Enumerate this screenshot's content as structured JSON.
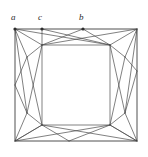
{
  "figure": {
    "kind": "geometric-line-diagram",
    "background_color": "#ffffff",
    "stroke_color": "#4a4a4a",
    "frame_color": "#3c3c3c",
    "label_color": "#2b2b2b",
    "canvas": {
      "width": 148,
      "height": 157
    },
    "frame": {
      "name": "outer-square",
      "corners": [
        {
          "name": "top-left",
          "x": 15,
          "y": 29
        },
        {
          "name": "top-right",
          "x": 137,
          "y": 29
        },
        {
          "name": "bottom-right",
          "x": 137,
          "y": 141
        },
        {
          "name": "bottom-left",
          "x": 15,
          "y": 141
        }
      ]
    },
    "labels": [
      {
        "id": "a",
        "text": "a",
        "x": 11,
        "y": 13,
        "vertex_x": 15,
        "vertex_y": 29
      },
      {
        "id": "c",
        "text": "c",
        "x": 38,
        "y": 13,
        "vertex_x": 42,
        "vertex_y": 29
      },
      {
        "id": "b",
        "text": "b",
        "x": 79,
        "y": 13,
        "vertex_x": 83,
        "vertex_y": 29
      }
    ],
    "marked_vertices": [
      {
        "id": "a",
        "x": 15,
        "y": 29
      },
      {
        "id": "c",
        "x": 42,
        "y": 29
      },
      {
        "id": "b",
        "x": 83,
        "y": 29
      }
    ],
    "interior_nodes": [
      {
        "id": "n-top-left-in",
        "x": 42,
        "y": 45
      },
      {
        "id": "n-top-right-in",
        "x": 110,
        "y": 45
      },
      {
        "id": "n-bottom-left-in",
        "x": 42,
        "y": 125
      },
      {
        "id": "n-bottom-right-in",
        "x": 110,
        "y": 125
      },
      {
        "id": "n-left-upper",
        "x": 27,
        "y": 57
      },
      {
        "id": "n-left-lower",
        "x": 27,
        "y": 113
      },
      {
        "id": "n-right-upper",
        "x": 125,
        "y": 57
      },
      {
        "id": "n-right-lower",
        "x": 125,
        "y": 113
      },
      {
        "id": "n-top-mid",
        "x": 83,
        "y": 29
      },
      {
        "id": "n-bottom-mid",
        "x": 69,
        "y": 141
      },
      {
        "id": "n-left-mid",
        "x": 15,
        "y": 85
      },
      {
        "id": "n-right-mid",
        "x": 137,
        "y": 71
      }
    ],
    "edges": [
      {
        "x1": 15,
        "y1": 29,
        "x2": 42,
        "y2": 45
      },
      {
        "x1": 15,
        "y1": 29,
        "x2": 27,
        "y2": 57
      },
      {
        "x1": 15,
        "y1": 29,
        "x2": 110,
        "y2": 45
      },
      {
        "x1": 42,
        "y1": 29,
        "x2": 42,
        "y2": 45
      },
      {
        "x1": 42,
        "y1": 29,
        "x2": 110,
        "y2": 45
      },
      {
        "x1": 83,
        "y1": 29,
        "x2": 42,
        "y2": 45
      },
      {
        "x1": 83,
        "y1": 29,
        "x2": 110,
        "y2": 45
      },
      {
        "x1": 137,
        "y1": 29,
        "x2": 110,
        "y2": 45
      },
      {
        "x1": 137,
        "y1": 29,
        "x2": 125,
        "y2": 57
      },
      {
        "x1": 137,
        "y1": 29,
        "x2": 42,
        "y2": 45
      },
      {
        "x1": 42,
        "y1": 45,
        "x2": 110,
        "y2": 45
      },
      {
        "x1": 42,
        "y1": 45,
        "x2": 27,
        "y2": 57
      },
      {
        "x1": 110,
        "y1": 45,
        "x2": 125,
        "y2": 57
      },
      {
        "x1": 15,
        "y1": 29,
        "x2": 27,
        "y2": 113
      },
      {
        "x1": 27,
        "y1": 57,
        "x2": 15,
        "y2": 85
      },
      {
        "x1": 27,
        "y1": 57,
        "x2": 42,
        "y2": 125
      },
      {
        "x1": 42,
        "y1": 45,
        "x2": 27,
        "y2": 113
      },
      {
        "x1": 42,
        "y1": 45,
        "x2": 42,
        "y2": 125
      },
      {
        "x1": 15,
        "y1": 85,
        "x2": 27,
        "y2": 113
      },
      {
        "x1": 27,
        "y1": 113,
        "x2": 42,
        "y2": 125
      },
      {
        "x1": 137,
        "y1": 29,
        "x2": 125,
        "y2": 113
      },
      {
        "x1": 125,
        "y1": 57,
        "x2": 137,
        "y2": 71
      },
      {
        "x1": 125,
        "y1": 57,
        "x2": 110,
        "y2": 125
      },
      {
        "x1": 110,
        "y1": 45,
        "x2": 125,
        "y2": 113
      },
      {
        "x1": 110,
        "y1": 45,
        "x2": 110,
        "y2": 125
      },
      {
        "x1": 137,
        "y1": 71,
        "x2": 125,
        "y2": 113
      },
      {
        "x1": 125,
        "y1": 113,
        "x2": 110,
        "y2": 125
      },
      {
        "x1": 42,
        "y1": 125,
        "x2": 110,
        "y2": 125
      },
      {
        "x1": 15,
        "y1": 141,
        "x2": 42,
        "y2": 125
      },
      {
        "x1": 15,
        "y1": 141,
        "x2": 27,
        "y2": 113
      },
      {
        "x1": 15,
        "y1": 141,
        "x2": 110,
        "y2": 125
      },
      {
        "x1": 69,
        "y1": 141,
        "x2": 42,
        "y2": 125
      },
      {
        "x1": 69,
        "y1": 141,
        "x2": 110,
        "y2": 125
      },
      {
        "x1": 137,
        "y1": 141,
        "x2": 110,
        "y2": 125
      },
      {
        "x1": 137,
        "y1": 141,
        "x2": 125,
        "y2": 113
      },
      {
        "x1": 137,
        "y1": 141,
        "x2": 42,
        "y2": 125
      },
      {
        "x1": 110,
        "y1": 125,
        "x2": 137,
        "y2": 141
      },
      {
        "x1": 42,
        "y1": 125,
        "x2": 15,
        "y2": 141
      }
    ]
  }
}
